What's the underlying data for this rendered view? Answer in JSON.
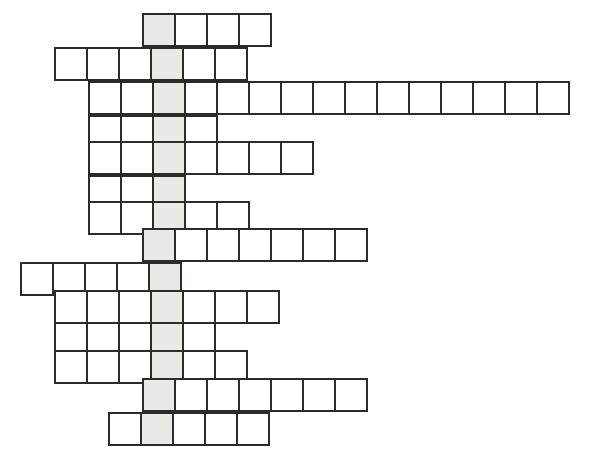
{
  "puzzle": {
    "type": "crossword-skeleton-grid",
    "title": "",
    "cell_size_px": 34,
    "border_color": "#2b2b2b",
    "cell_fill": "#ffffff",
    "highlight_fill": "#e9e9e6",
    "background": "#ffffff",
    "highlight_column_index": 4,
    "row_count": 13,
    "rows": [
      {
        "index": 0,
        "x": 142,
        "y": 13,
        "start_col": 4,
        "length": 4,
        "letters": [
          "",
          "",
          "",
          ""
        ]
      },
      {
        "index": 1,
        "x": 54,
        "y": 47,
        "start_col": 1,
        "length": 6,
        "letters": [
          "",
          "",
          "",
          "",
          "",
          ""
        ]
      },
      {
        "index": 2,
        "x": 88,
        "y": 81,
        "start_col": 2,
        "length": 15,
        "letters": [
          "",
          "",
          "",
          "",
          "",
          "",
          "",
          "",
          "",
          "",
          "",
          "",
          "",
          "",
          ""
        ]
      },
      {
        "index": 3,
        "x": 88,
        "y": 115,
        "start_col": 2,
        "length": 4,
        "letters": [
          "",
          "",
          "",
          ""
        ]
      },
      {
        "index": 4,
        "x": 88,
        "y": 141,
        "start_col": 2,
        "length": 7,
        "letters": [
          "",
          "",
          "",
          "",
          "",
          "",
          ""
        ]
      },
      {
        "index": 5,
        "x": 88,
        "y": 175,
        "start_col": 2,
        "length": 3,
        "letters": [
          "",
          "",
          ""
        ]
      },
      {
        "index": 6,
        "x": 88,
        "y": 201,
        "start_col": 2,
        "length": 5,
        "letters": [
          "",
          "",
          "",
          "",
          ""
        ]
      },
      {
        "index": 7,
        "x": 142,
        "y": 228,
        "start_col": 4,
        "length": 7,
        "letters": [
          "",
          "",
          "",
          "",
          "",
          "",
          ""
        ]
      },
      {
        "index": 8,
        "x": 20,
        "y": 262,
        "start_col": 0,
        "length": 5,
        "letters": [
          "",
          "",
          "",
          "",
          ""
        ]
      },
      {
        "index": 9,
        "x": 54,
        "y": 290,
        "start_col": 1,
        "length": 7,
        "letters": [
          "",
          "",
          "",
          "",
          "",
          "",
          ""
        ]
      },
      {
        "index": 10,
        "x": 54,
        "y": 322,
        "start_col": 1,
        "length": 5,
        "letters": [
          "",
          "",
          "",
          "",
          ""
        ]
      },
      {
        "index": 11,
        "x": 54,
        "y": 350,
        "start_col": 1,
        "length": 6,
        "letters": [
          "",
          "",
          "",
          "",
          "",
          ""
        ]
      },
      {
        "index": 12,
        "x": 142,
        "y": 378,
        "start_col": 4,
        "length": 7,
        "letters": [
          "",
          "",
          "",
          "",
          "",
          "",
          ""
        ]
      },
      {
        "index": 13,
        "x": 108,
        "y": 412,
        "start_col": 3,
        "length": 5,
        "letters": [
          "",
          "",
          "",
          "",
          ""
        ]
      }
    ]
  }
}
